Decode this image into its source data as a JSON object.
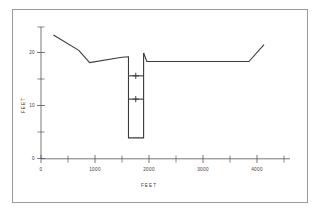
{
  "figure": {
    "background_color": "#ffffff",
    "border_color": "#9a9a9a",
    "line_color": "#3a3a3a",
    "axis_color": "#555555"
  },
  "chart_data": {
    "type": "line",
    "title": "",
    "subtitle": "",
    "xlabel": "FEET",
    "ylabel": "FEET",
    "xlim": [
      0,
      4600
    ],
    "ylim": [
      0,
      26
    ],
    "grid": false,
    "legend": null,
    "x_ticks_major": [
      0,
      1000,
      2000,
      3000,
      4000
    ],
    "x_tick_labels": [
      "0",
      "1000",
      "2000",
      "3000",
      "4000"
    ],
    "x_ticks_minor": [
      500,
      1500,
      2500,
      3500,
      4500
    ],
    "y_ticks_major": [
      0,
      10,
      20
    ],
    "y_tick_labels": [
      "0",
      "10",
      "20"
    ],
    "y_ticks_minor": [
      5,
      15,
      25
    ],
    "series": [
      {
        "name": "ground-surface-left",
        "x": [
          230,
          700,
          900,
          1500,
          1620,
          1620
        ],
        "y": [
          23.3,
          20.4,
          18.1,
          19.1,
          19.2,
          15.6
        ]
      },
      {
        "name": "trench-cut",
        "x": [
          1620,
          1620,
          1900,
          1900
        ],
        "y": [
          15.6,
          3.9,
          3.9,
          19.9
        ]
      },
      {
        "name": "ground-surface-right",
        "x": [
          1900,
          1960,
          3850,
          4130
        ],
        "y": [
          19.9,
          18.3,
          18.3,
          21.5
        ]
      }
    ],
    "annotations": [
      {
        "name": "upper-level-line",
        "type": "horizontal-segment-with-marker",
        "x_start": 1620,
        "x_end": 1900,
        "y": 15.6,
        "marker_x": 1755,
        "marker": "plus"
      },
      {
        "name": "lower-level-line",
        "type": "horizontal-segment-with-marker",
        "x_start": 1620,
        "x_end": 1900,
        "y": 11.2,
        "marker_x": 1755,
        "marker": "plus"
      }
    ]
  },
  "labels": {
    "x_axis_title": "FEET",
    "y_axis_title": "FEET",
    "y0": "0",
    "y10": "10",
    "y20": "20",
    "x0": "0",
    "x1000": "1000",
    "x2000": "2000",
    "x3000": "3000",
    "x4000": "4000"
  }
}
